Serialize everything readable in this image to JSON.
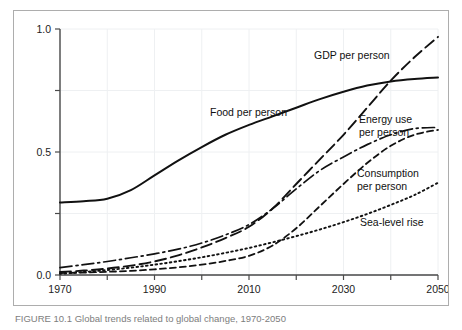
{
  "caption": "FIGURE 10.1  Global trends related to global change, 1970-2050",
  "chart_data": {
    "type": "line",
    "title": "",
    "xlabel": "",
    "ylabel": "",
    "xlim": [
      1970,
      2050
    ],
    "ylim": [
      0.0,
      1.0
    ],
    "grid": true,
    "legend_position": "inline-annotations",
    "x_ticks": [
      1970,
      1990,
      2010,
      2030,
      2050
    ],
    "x_tick_labels": [
      "1970",
      "1990",
      "2010",
      "2030",
      "2050"
    ],
    "x_minor_ticks": [
      1980,
      2000,
      2020,
      2040
    ],
    "y_ticks": [
      0.0,
      0.5,
      1.0
    ],
    "y_tick_labels": [
      "0.0",
      "0.5",
      "1.0"
    ],
    "y_minor_ticks": [
      0.25,
      0.75
    ],
    "x": [
      1970,
      1975,
      1980,
      1985,
      1990,
      1995,
      2000,
      2005,
      2010,
      2015,
      2020,
      2025,
      2030,
      2035,
      2040,
      2045,
      2050
    ],
    "series": [
      {
        "name": "Food per person",
        "style": "solid",
        "dash": "none",
        "color": "#111111",
        "width": 2.0,
        "label": "Food per person",
        "label_x": 196,
        "label_y": 105,
        "values": [
          0.295,
          0.3,
          0.31,
          0.345,
          0.405,
          0.465,
          0.52,
          0.57,
          0.61,
          0.645,
          0.68,
          0.715,
          0.745,
          0.77,
          0.787,
          0.797,
          0.803
        ]
      },
      {
        "name": "GDP per person",
        "style": "long-dash",
        "dash": "11,5",
        "color": "#111111",
        "width": 1.9,
        "label": "GDP per person",
        "label_x": 300,
        "label_y": 48,
        "values": [
          0.012,
          0.018,
          0.026,
          0.038,
          0.055,
          0.08,
          0.112,
          0.15,
          0.196,
          0.27,
          0.37,
          0.47,
          0.57,
          0.68,
          0.79,
          0.885,
          0.968
        ]
      },
      {
        "name": "Energy use per person",
        "style": "dash-dot",
        "dash": "12,4,2,4",
        "color": "#111111",
        "width": 1.7,
        "label_lines": [
          "Energy use",
          "per person"
        ],
        "label_x": 345,
        "label_y": 112,
        "values": [
          0.03,
          0.042,
          0.055,
          0.07,
          0.086,
          0.105,
          0.13,
          0.163,
          0.205,
          0.27,
          0.35,
          0.425,
          0.48,
          0.53,
          0.57,
          0.595,
          0.6
        ]
      },
      {
        "name": "Consumption per person",
        "style": "short-dash",
        "dash": "6,4",
        "color": "#111111",
        "width": 1.8,
        "label_lines": [
          "Consumption",
          "per person"
        ],
        "label_x": 343,
        "label_y": 166,
        "values": [
          0.008,
          0.01,
          0.013,
          0.017,
          0.023,
          0.031,
          0.042,
          0.057,
          0.078,
          0.12,
          0.19,
          0.28,
          0.37,
          0.455,
          0.525,
          0.57,
          0.59
        ]
      },
      {
        "name": "Sea-level rise",
        "style": "dotted",
        "dash": "1.6,3.2",
        "color": "#111111",
        "width": 1.9,
        "label": "Sea-level rise",
        "label_x": 346,
        "label_y": 215,
        "values": [
          0.005,
          0.012,
          0.02,
          0.03,
          0.042,
          0.056,
          0.072,
          0.09,
          0.11,
          0.133,
          0.158,
          0.185,
          0.215,
          0.248,
          0.285,
          0.325,
          0.375
        ]
      }
    ]
  }
}
